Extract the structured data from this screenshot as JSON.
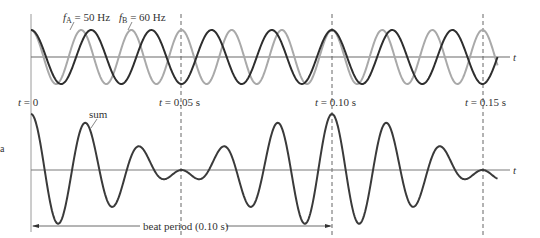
{
  "figure": {
    "top_panel": {
      "legend": {
        "wave_a": {
          "symbol": "f",
          "subscript": "A",
          "text": " = 50 Hz"
        },
        "wave_b": {
          "symbol": "f",
          "subscript": "B",
          "text": " = 60 Hz"
        }
      },
      "axis_label": "t"
    },
    "time_markers": [
      {
        "label_var": "t",
        "label_text": " = 0"
      },
      {
        "label_var": "t",
        "label_text": " = 0.05 s"
      },
      {
        "label_var": "t",
        "label_text": " = 0.10 s"
      },
      {
        "label_var": "t",
        "label_text": " = 0.15 s"
      }
    ],
    "bottom_panel": {
      "sum_label": "sum",
      "axis_label": "t",
      "beat_period_label": "beat period (0.10 s)"
    },
    "side_fragment": "a"
  },
  "colors": {
    "wave_a": "#2e2e2e",
    "wave_b": "#a9a9a9",
    "sum": "#3a3a3a",
    "axis": "#6b6b6b",
    "marker": "#555555"
  },
  "chart_data": {
    "type": "line",
    "title": "",
    "xlabel": "t",
    "ylabel": "",
    "xlim": [
      0,
      0.155
    ],
    "series": [
      {
        "name": "f_A = 50 Hz",
        "frequency_hz": 50,
        "amplitude": 1,
        "form": "cos(2*pi*50*t)",
        "color": "#2e2e2e",
        "panel": "top"
      },
      {
        "name": "f_B = 60 Hz",
        "frequency_hz": 60,
        "amplitude": 1,
        "form": "cos(2*pi*60*t)",
        "color": "#a9a9a9",
        "panel": "top"
      },
      {
        "name": "sum",
        "form": "cos(2*pi*50*t) + cos(2*pi*60*t)",
        "amplitude_max": 2,
        "color": "#3a3a3a",
        "panel": "bottom"
      }
    ],
    "markers_s": [
      0,
      0.05,
      0.1,
      0.15
    ],
    "beat_period_s": 0.1,
    "grid": false,
    "legend_position": "top-left inline"
  }
}
